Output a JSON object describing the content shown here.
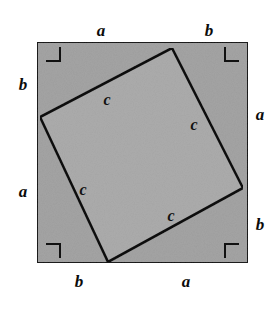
{
  "figure": {
    "canvas": {
      "width": 275,
      "height": 309,
      "background": "#ffffff"
    }
  },
  "outer_square": {
    "name": "outer-square",
    "fill": "#a4a4a4",
    "stroke": "#1a1a1a",
    "stroke_width": 2,
    "x": 37,
    "y": 42,
    "width": 211,
    "height": 221
  },
  "inner_square": {
    "name": "inner-tilted-square",
    "fill": "#acacac",
    "stroke": "#111111",
    "stroke_width": 2.6,
    "points": "172,48 243,188 108,262 40,117",
    "vertices": [
      {
        "label": "top",
        "x": 172,
        "y": 48
      },
      {
        "label": "right",
        "x": 243,
        "y": 188
      },
      {
        "label": "bottom",
        "x": 108,
        "y": 262
      },
      {
        "label": "left",
        "x": 40,
        "y": 117
      }
    ]
  },
  "right_angle_markers": [
    {
      "name": "right-angle-marker-top-left",
      "path": "M 46 61 L 60 61 L 60 47"
    },
    {
      "name": "right-angle-marker-top-right",
      "path": "M 239 61 L 225 61 L 225 47"
    },
    {
      "name": "right-angle-marker-bottom-left",
      "path": "M 46 244 L 60 244 L 60 258"
    },
    {
      "name": "right-angle-marker-bottom-right",
      "path": "M 239 244 L 225 244 L 225 258"
    }
  ],
  "labels": {
    "outer": [
      {
        "name": "label-top-a",
        "text": "a",
        "x": 101,
        "y": 30,
        "side": "top"
      },
      {
        "name": "label-top-b",
        "text": "b",
        "x": 209,
        "y": 30,
        "side": "top"
      },
      {
        "name": "label-left-b",
        "text": "b",
        "x": 23,
        "y": 84,
        "side": "left"
      },
      {
        "name": "label-left-a",
        "text": "a",
        "x": 23,
        "y": 191,
        "side": "left"
      },
      {
        "name": "label-right-a",
        "text": "a",
        "x": 260,
        "y": 114,
        "side": "right"
      },
      {
        "name": "label-right-b",
        "text": "b",
        "x": 260,
        "y": 224,
        "side": "right"
      },
      {
        "name": "label-bottom-b",
        "text": "b",
        "x": 79,
        "y": 281,
        "side": "bottom"
      },
      {
        "name": "label-bottom-a",
        "text": "a",
        "x": 186,
        "y": 281,
        "side": "bottom"
      }
    ],
    "inner": [
      {
        "name": "label-hypotenuse-top-left",
        "text": "c",
        "x": 107,
        "y": 100
      },
      {
        "name": "label-hypotenuse-top-right",
        "text": "c",
        "x": 194,
        "y": 125
      },
      {
        "name": "label-hypotenuse-bottom-left",
        "text": "c",
        "x": 83,
        "y": 190
      },
      {
        "name": "label-hypotenuse-bottom-right",
        "text": "c",
        "x": 171,
        "y": 216
      }
    ]
  }
}
